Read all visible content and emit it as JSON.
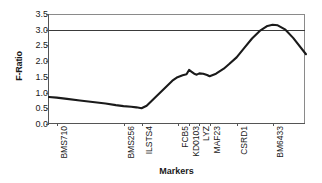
{
  "chart_data": {
    "type": "line",
    "title": "",
    "xlabel": "Markers",
    "ylabel": "F-Ratio",
    "ylim": [
      0.0,
      3.5
    ],
    "yticks": [
      "0.0",
      "0.5",
      "1.0",
      "1.5",
      "2.0",
      "2.5",
      "3.0",
      "3.5"
    ],
    "ytick_values": [
      0.0,
      0.5,
      1.0,
      1.5,
      2.0,
      2.5,
      3.0,
      3.5
    ],
    "grid": false,
    "legend": "none",
    "categories": [
      "BMS710",
      "BMS256",
      "ILSTS4",
      "FCB5",
      "KD0103",
      "LYZ",
      "MAF23",
      "CSRD1",
      "BM6433"
    ],
    "marker_positions": [
      0.03,
      0.29,
      0.36,
      0.5,
      0.545,
      0.585,
      0.625,
      0.73,
      0.87
    ],
    "threshold": {
      "value": 3.0,
      "label": ""
    },
    "series": [
      {
        "name": "F-Ratio",
        "x": [
          0.0,
          0.03,
          0.07,
          0.12,
          0.17,
          0.22,
          0.26,
          0.29,
          0.32,
          0.34,
          0.36,
          0.38,
          0.4,
          0.42,
          0.44,
          0.46,
          0.48,
          0.5,
          0.52,
          0.535,
          0.545,
          0.555,
          0.565,
          0.575,
          0.585,
          0.6,
          0.615,
          0.625,
          0.65,
          0.68,
          0.7,
          0.73,
          0.76,
          0.79,
          0.82,
          0.85,
          0.87,
          0.89,
          0.92,
          0.95,
          1.0
        ],
        "values": [
          0.86,
          0.84,
          0.8,
          0.75,
          0.7,
          0.65,
          0.6,
          0.57,
          0.55,
          0.53,
          0.5,
          0.58,
          0.74,
          0.9,
          1.06,
          1.22,
          1.38,
          1.49,
          1.55,
          1.58,
          1.72,
          1.66,
          1.6,
          1.57,
          1.61,
          1.6,
          1.56,
          1.52,
          1.6,
          1.76,
          1.9,
          2.12,
          2.42,
          2.72,
          2.96,
          3.12,
          3.16,
          3.14,
          3.0,
          2.74,
          2.22
        ]
      }
    ],
    "colors": {
      "line": "#1a1a1a",
      "threshold": "#3a3a3a",
      "axis": "#555555",
      "frame": "#8a8a8a",
      "background": "#ffffff"
    }
  }
}
